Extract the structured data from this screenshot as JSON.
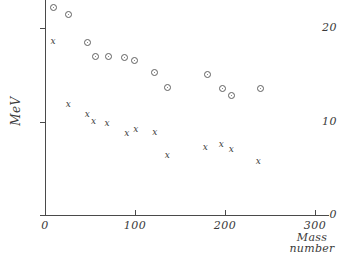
{
  "chart_data": {
    "type": "scatter",
    "title": "",
    "xlabel": "Mass number",
    "ylabel": "MeV",
    "xlim": [
      0,
      315
    ],
    "ylim": [
      0,
      23
    ],
    "grid": false,
    "legend": "none",
    "xticks": [
      0,
      100,
      200,
      300
    ],
    "xtick_labels": [
      "0",
      "100",
      "200",
      "300"
    ],
    "yticks": [
      0,
      10,
      20
    ],
    "ytick_labels": [
      "0",
      "10",
      "20"
    ],
    "series": [
      {
        "name": "open-circle-series",
        "marker": "circle",
        "color": "#5f5f5f",
        "points": [
          {
            "x": 9,
            "y": 22.2
          },
          {
            "x": 26,
            "y": 21.4
          },
          {
            "x": 47,
            "y": 18.5
          },
          {
            "x": 56,
            "y": 17.0
          },
          {
            "x": 71,
            "y": 17.0
          },
          {
            "x": 88,
            "y": 16.8
          },
          {
            "x": 99,
            "y": 16.5
          },
          {
            "x": 122,
            "y": 15.2
          },
          {
            "x": 136,
            "y": 13.6
          },
          {
            "x": 180,
            "y": 15.0
          },
          {
            "x": 197,
            "y": 13.5
          },
          {
            "x": 207,
            "y": 12.8
          },
          {
            "x": 239,
            "y": 13.5
          }
        ]
      },
      {
        "name": "cross-series",
        "marker": "x",
        "color": "#3c3c3c",
        "points": [
          {
            "x": 9,
            "y": 18.6
          },
          {
            "x": 26,
            "y": 11.8
          },
          {
            "x": 47,
            "y": 10.8
          },
          {
            "x": 54,
            "y": 10.0
          },
          {
            "x": 69,
            "y": 9.8
          },
          {
            "x": 91,
            "y": 8.7
          },
          {
            "x": 101,
            "y": 9.1
          },
          {
            "x": 122,
            "y": 8.8
          },
          {
            "x": 136,
            "y": 6.4
          },
          {
            "x": 178,
            "y": 7.2
          },
          {
            "x": 196,
            "y": 7.5
          },
          {
            "x": 207,
            "y": 7.0
          },
          {
            "x": 237,
            "y": 5.7
          }
        ]
      }
    ]
  },
  "axes": {
    "y_title": "MeV",
    "x_title_line1": "Mass",
    "x_title_line2": "number"
  }
}
